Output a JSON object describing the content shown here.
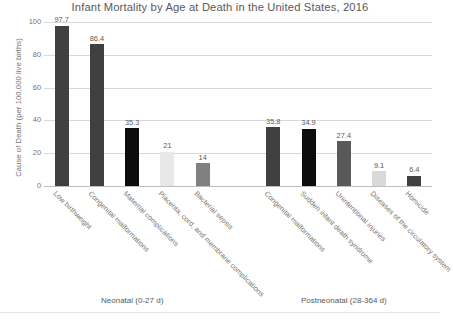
{
  "chart_data": {
    "type": "bar",
    "title": "Infant Mortality by Age at Death in the United States, 2016",
    "xlabel": "",
    "ylabel": "Cause of Death (per 100,000 live births)",
    "ylim": [
      0,
      100
    ],
    "yticks": [
      0,
      20,
      40,
      60,
      80,
      100
    ],
    "ytick_labels": [
      "0",
      "20",
      "40",
      "60",
      "80",
      "100"
    ],
    "grid": true,
    "legend": "none",
    "categories": [
      "Low birthweight",
      "Congenital malformations",
      "Maternal complications",
      "Placenta, cord, and membrane complications",
      "Bacterial sepsis",
      "Congenital malformations",
      "Sudden infant death syndrome",
      "Unintentional injuries",
      "Diseases of the circulatory system",
      "Homicide"
    ],
    "values": [
      97.7,
      86.4,
      35.3,
      21,
      14,
      35.8,
      34.9,
      27.4,
      9.1,
      6.4
    ],
    "value_labels": [
      "97.7",
      "86.4",
      "35.3",
      "21",
      "14",
      "35.8",
      "34.9",
      "27.4",
      "9.1",
      "6.4"
    ],
    "bar_colors": [
      "#404040",
      "#404040",
      "#0d0d0d",
      "#e8e8e8",
      "#808080",
      "#404040",
      "#0d0d0d",
      "#595959",
      "#d9d9d9",
      "#404040"
    ],
    "slot_count": 11,
    "slot_indices": [
      0,
      1,
      2,
      3,
      4,
      6,
      7,
      8,
      9,
      10
    ],
    "groups": [
      {
        "label": "Neonatal (0-27 d)",
        "center_slot": 2
      },
      {
        "label": "Postneonatal (28-364 d)",
        "center_slot": 8
      }
    ],
    "colors": {
      "background": "#ffffff",
      "gridline": "#d9d9d9",
      "axis": "#bfbfbf",
      "text": "#595959",
      "tick_text": "#737373"
    }
  }
}
